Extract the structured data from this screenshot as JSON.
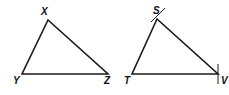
{
  "diagram": {
    "triangle_xyz": {
      "labels": {
        "x": "X",
        "y": "Y",
        "z": "Z"
      }
    },
    "triangle_stv": {
      "labels": {
        "s": "S",
        "t": "T",
        "v": "V"
      },
      "tick_marks": [
        "S",
        "V"
      ]
    },
    "stroke_color": "#1a1a1a"
  }
}
